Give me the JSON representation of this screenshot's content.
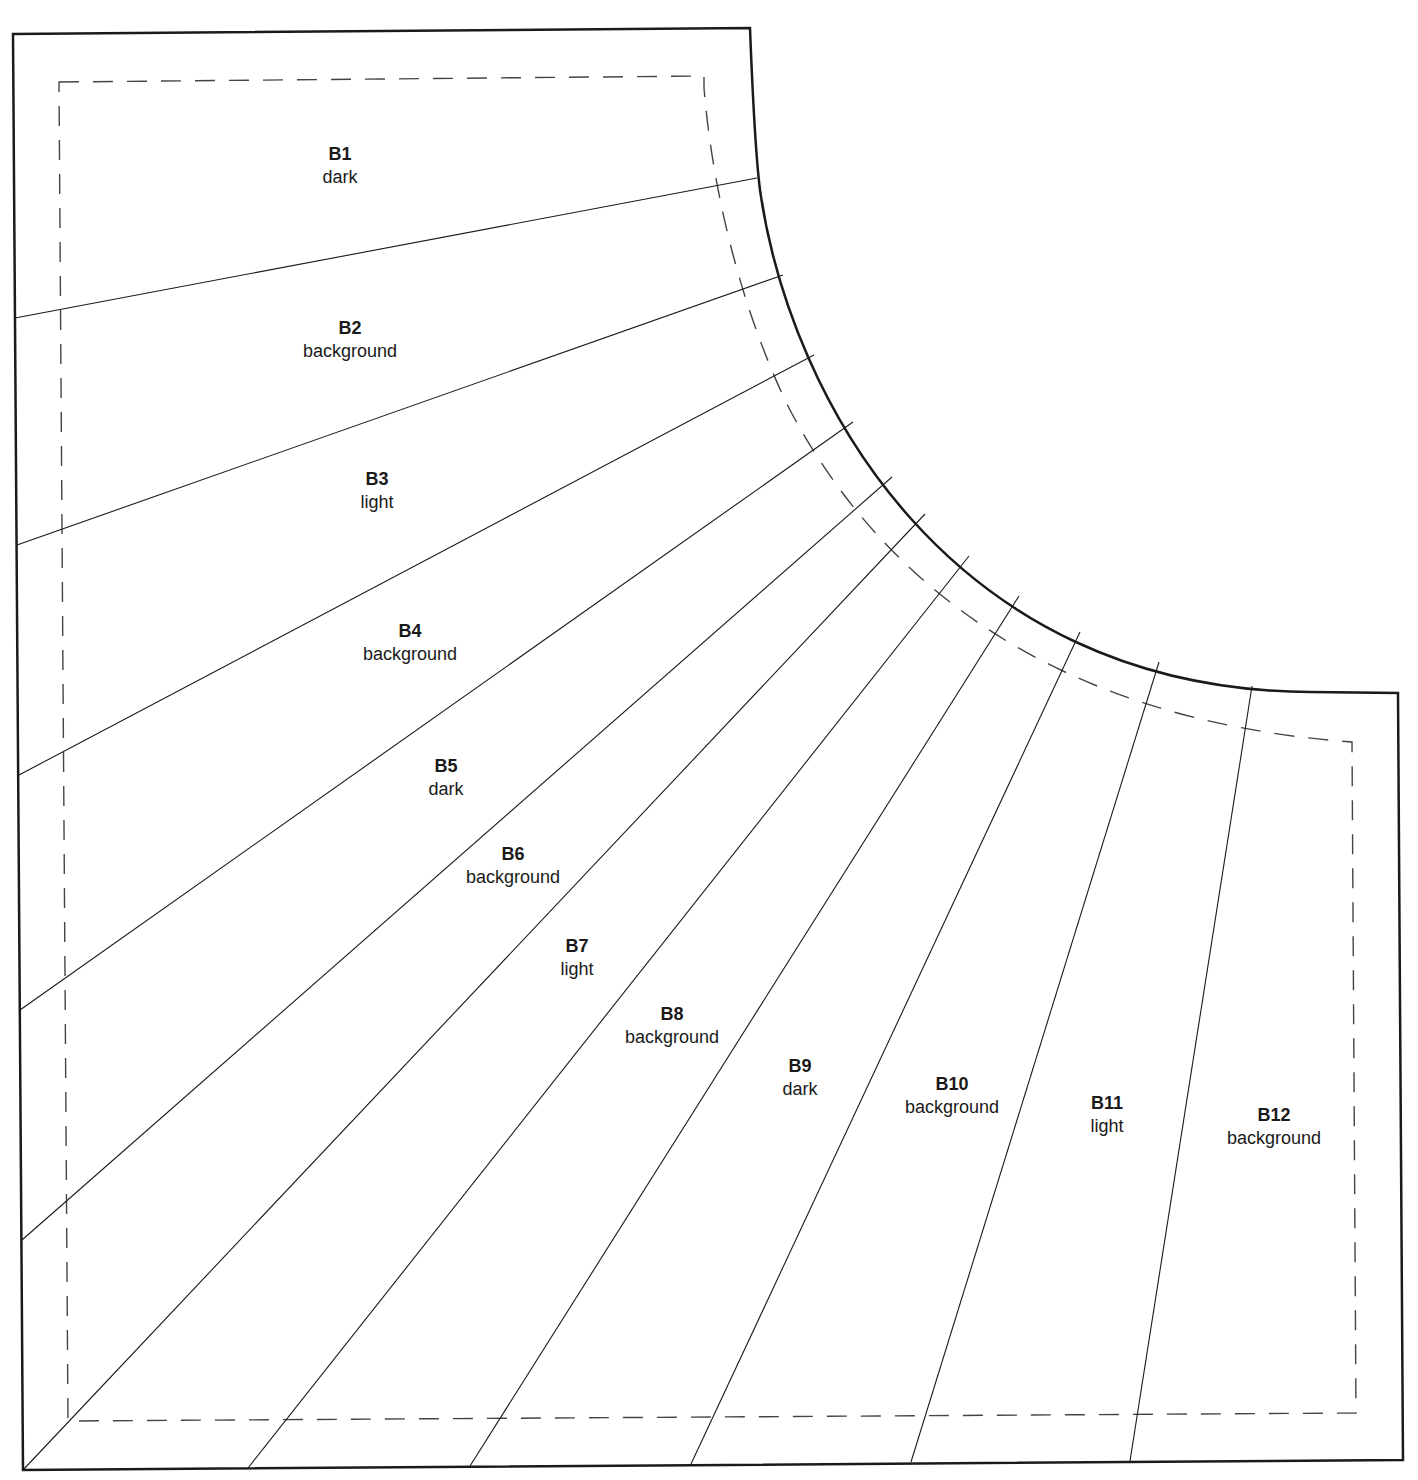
{
  "pattern": {
    "outline_color": "#1a1a1a",
    "seam_color": "#333333",
    "sections": [
      {
        "id": "B1",
        "fabric": "dark",
        "x": 340,
        "y": 143
      },
      {
        "id": "B2",
        "fabric": "background",
        "x": 350,
        "y": 317
      },
      {
        "id": "B3",
        "fabric": "light",
        "x": 377,
        "y": 468
      },
      {
        "id": "B4",
        "fabric": "background",
        "x": 410,
        "y": 620
      },
      {
        "id": "B5",
        "fabric": "dark",
        "x": 446,
        "y": 755
      },
      {
        "id": "B6",
        "fabric": "background",
        "x": 513,
        "y": 843
      },
      {
        "id": "B7",
        "fabric": "light",
        "x": 577,
        "y": 935
      },
      {
        "id": "B8",
        "fabric": "background",
        "x": 672,
        "y": 1003
      },
      {
        "id": "B9",
        "fabric": "dark",
        "x": 800,
        "y": 1055
      },
      {
        "id": "B10",
        "fabric": "background",
        "x": 952,
        "y": 1073
      },
      {
        "id": "B11",
        "fabric": "light",
        "x": 1107,
        "y": 1092
      },
      {
        "id": "B12",
        "fabric": "background",
        "x": 1274,
        "y": 1104
      }
    ]
  }
}
